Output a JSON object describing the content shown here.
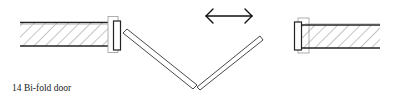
{
  "figure": {
    "caption": "14 Bi-fold door",
    "colors": {
      "line": "#222222",
      "hatch": "#8a8a8a",
      "stop": "#9a9a9a",
      "background": "#ffffff"
    },
    "elements": [
      {
        "name": "left-wall",
        "type": "hatched-wall-section"
      },
      {
        "name": "left-door-frame",
        "type": "frame-post"
      },
      {
        "name": "left-door-leaf",
        "type": "bi-fold-panel"
      },
      {
        "name": "right-door-leaf",
        "type": "bi-fold-panel"
      },
      {
        "name": "right-door-frame",
        "type": "frame-post"
      },
      {
        "name": "right-wall",
        "type": "hatched-wall-section"
      },
      {
        "name": "sliding-direction-arrow",
        "type": "double-headed-arrow"
      }
    ]
  }
}
